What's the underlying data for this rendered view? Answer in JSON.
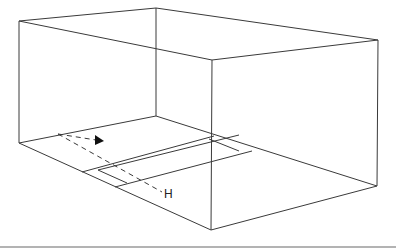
{
  "diagram": {
    "type": "perspective-box-room",
    "labels": {
      "h_label": "H"
    },
    "colors": {
      "line": "#3a3a3a",
      "rule": "#9a9a9a",
      "background": "#ffffff"
    },
    "elements": [
      "box-wireframe",
      "floor-rectangle-strip",
      "dashed-direction-line-with-arrow",
      "dashed-line-to-H",
      "bottom-horizontal-rule"
    ]
  }
}
